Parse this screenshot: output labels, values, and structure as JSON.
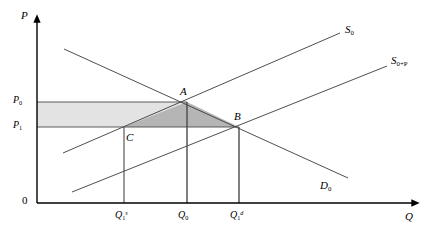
{
  "figure": {
    "kind": "supply-demand-diagram",
    "title": "",
    "background": "#ffffff",
    "line_color": "#3a3a3a",
    "axis_color": "#000000",
    "band_fill": "#e3e3e3",
    "triangle_fill": "#b5b5b5"
  },
  "axes": {
    "y_label": "P",
    "x_label": "Q",
    "origin_label": "0",
    "x_axis_from": [
      37,
      203
    ],
    "x_axis_to": [
      412,
      203
    ],
    "y_axis_from": [
      37,
      203
    ],
    "y_axis_to": [
      37,
      22
    ]
  },
  "price_ticks": [
    {
      "label_base": "P",
      "label_sub": "0",
      "y": 102
    },
    {
      "label_base": "P",
      "label_sub": "1",
      "y": 127
    }
  ],
  "quantity_ticks": [
    {
      "label_base": "Q",
      "label_sub": "1",
      "label_sup": "s",
      "x": 124
    },
    {
      "label_base": "Q",
      "label_sub": "0",
      "label_sup": "",
      "x": 187
    },
    {
      "label_base": "Q",
      "label_sub": "1",
      "label_sup": "d",
      "x": 239
    }
  ],
  "curves": [
    {
      "name": "supply-original",
      "label_base": "S",
      "label_sub": "0",
      "label_x": 345,
      "label_y": 24,
      "from": [
        63,
        153
      ],
      "to": [
        340,
        33
      ]
    },
    {
      "name": "supply-shifted",
      "label_base": "S",
      "label_sub": "0+P",
      "label_x": 391,
      "label_y": 55,
      "from": [
        72,
        192
      ],
      "to": [
        387,
        66
      ]
    },
    {
      "name": "demand",
      "label_base": "D",
      "label_sub": "0",
      "label_x": 320,
      "label_y": 180,
      "from": [
        64,
        49
      ],
      "to": [
        348,
        178
      ]
    }
  ],
  "points": [
    {
      "name": "A",
      "label": "A",
      "x": 187,
      "y": 102,
      "label_x": 180,
      "label_y": 86
    },
    {
      "name": "B",
      "label": "B",
      "x": 239,
      "y": 127,
      "label_x": 234,
      "label_y": 111
    },
    {
      "name": "C",
      "label": "C",
      "x": 124,
      "y": 127,
      "label_x": 126,
      "label_y": 132
    }
  ],
  "shaded_regions": [
    {
      "name": "price-band-rectangle",
      "fill": "#e3e3e3",
      "points": "37,102 187,102 187,127 37,127"
    },
    {
      "name": "welfare-triangle-ACB",
      "fill": "#b5b5b5",
      "points": "187,102 239,127 124,127"
    }
  ],
  "drop_lines": [
    {
      "name": "drop-Q1s",
      "x": 124,
      "y_top": 127,
      "y_bottom": 203
    },
    {
      "name": "drop-Q0",
      "x": 187,
      "y_top": 102,
      "y_bottom": 203
    },
    {
      "name": "drop-Q1d",
      "x": 239,
      "y_top": 127,
      "y_bottom": 203
    }
  ],
  "price_lines": [
    {
      "name": "price-line-P0",
      "y": 102,
      "x_from": 37,
      "x_to": 187
    },
    {
      "name": "price-line-P1",
      "y": 127,
      "x_from": 37,
      "x_to": 239
    }
  ]
}
